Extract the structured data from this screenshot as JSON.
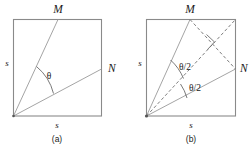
{
  "figure": {
    "background_color": "#ffffff",
    "stroke_color": "#8a8a8a",
    "dash_color": "#6f6f6f",
    "text_color": "#1a1a1a"
  },
  "panel_a": {
    "caption": "(a)",
    "point_m_label": "M",
    "point_n_label": "N",
    "side_left_label": "s",
    "side_bottom_label": "s",
    "angle_label": "θ"
  },
  "panel_b": {
    "caption": "(b)",
    "point_m_label": "M",
    "point_n_label": "N",
    "side_left_label": "s",
    "side_bottom_label": "s",
    "angle_upper_label": "θ/2",
    "angle_lower_label": "θ/2"
  }
}
